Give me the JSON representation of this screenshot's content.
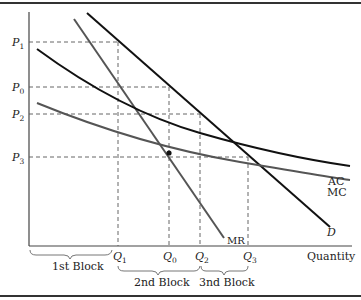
{
  "diagram": {
    "type": "economics-block-pricing",
    "axes": {
      "x_label": "Quantity",
      "y_label": ""
    },
    "price_levels": [
      {
        "id": "P1",
        "label": "P",
        "sub": "1"
      },
      {
        "id": "P0",
        "label": "P",
        "sub": "0"
      },
      {
        "id": "P2",
        "label": "P",
        "sub": "2"
      },
      {
        "id": "P3",
        "label": "P",
        "sub": "3"
      }
    ],
    "quantity_levels": [
      {
        "id": "Q1",
        "label": "Q",
        "sub": "1"
      },
      {
        "id": "Q0",
        "label": "Q",
        "sub": "0"
      },
      {
        "id": "Q2",
        "label": "Q",
        "sub": "2"
      },
      {
        "id": "Q3",
        "label": "Q",
        "sub": "3"
      }
    ],
    "curves": [
      {
        "id": "AC",
        "label": "AC",
        "color": "#111111"
      },
      {
        "id": "MC",
        "label": "MC",
        "color": "#555555"
      },
      {
        "id": "MR",
        "label": "MR",
        "color": "#555555"
      },
      {
        "id": "D",
        "label": "D",
        "color": "#111111"
      }
    ],
    "blocks": [
      {
        "label": "1st Block"
      },
      {
        "label": "2nd Block"
      },
      {
        "label": "3nd Block"
      }
    ]
  }
}
